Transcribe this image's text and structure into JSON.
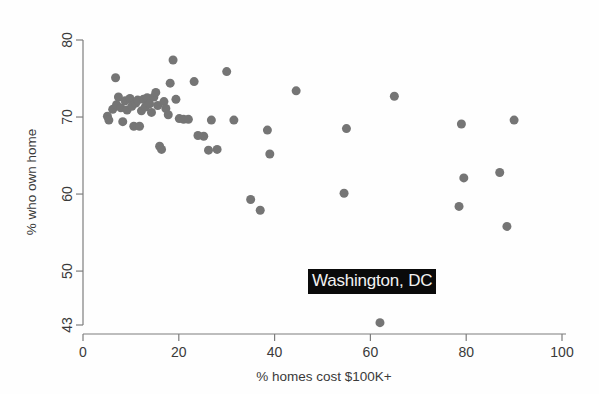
{
  "chart_data": {
    "type": "scatter",
    "title": "",
    "xlabel": "% homes cost $100K+",
    "ylabel": "% who own home",
    "xlim": [
      0,
      100
    ],
    "ylim": [
      43,
      80
    ],
    "xticks": [
      0,
      20,
      40,
      60,
      80,
      100
    ],
    "yticks": [
      43,
      50,
      60,
      70,
      80
    ],
    "grid": false,
    "legend": null,
    "marker": {
      "shape": "circle",
      "color": "#757575",
      "size": 9
    },
    "annotations": [
      {
        "label": "Washington, DC",
        "x": 62,
        "y": 48.5,
        "style": "white-on-black"
      }
    ],
    "points": [
      {
        "x": 5.1,
        "y": 70.1
      },
      {
        "x": 5.4,
        "y": 69.6
      },
      {
        "x": 6.2,
        "y": 71.0
      },
      {
        "x": 6.8,
        "y": 75.1
      },
      {
        "x": 7.0,
        "y": 71.6
      },
      {
        "x": 7.4,
        "y": 72.6
      },
      {
        "x": 7.9,
        "y": 71.2
      },
      {
        "x": 8.3,
        "y": 69.4
      },
      {
        "x": 8.8,
        "y": 72.1
      },
      {
        "x": 9.2,
        "y": 70.9
      },
      {
        "x": 9.8,
        "y": 72.4
      },
      {
        "x": 10.2,
        "y": 71.4
      },
      {
        "x": 10.6,
        "y": 68.8
      },
      {
        "x": 11.0,
        "y": 71.8
      },
      {
        "x": 11.4,
        "y": 72.2
      },
      {
        "x": 11.8,
        "y": 68.8
      },
      {
        "x": 12.2,
        "y": 70.8
      },
      {
        "x": 12.6,
        "y": 72.3
      },
      {
        "x": 13.0,
        "y": 71.3
      },
      {
        "x": 13.4,
        "y": 72.5
      },
      {
        "x": 13.9,
        "y": 71.7
      },
      {
        "x": 14.3,
        "y": 70.6
      },
      {
        "x": 14.8,
        "y": 72.6
      },
      {
        "x": 15.2,
        "y": 73.2
      },
      {
        "x": 15.6,
        "y": 71.5
      },
      {
        "x": 16.0,
        "y": 66.2
      },
      {
        "x": 16.4,
        "y": 65.8
      },
      {
        "x": 16.9,
        "y": 72.0
      },
      {
        "x": 17.3,
        "y": 71.1
      },
      {
        "x": 17.8,
        "y": 70.3
      },
      {
        "x": 18.2,
        "y": 74.4
      },
      {
        "x": 18.8,
        "y": 77.4
      },
      {
        "x": 19.4,
        "y": 72.3
      },
      {
        "x": 20.1,
        "y": 69.8
      },
      {
        "x": 21.0,
        "y": 69.7
      },
      {
        "x": 22.0,
        "y": 69.7
      },
      {
        "x": 23.2,
        "y": 74.6
      },
      {
        "x": 24.0,
        "y": 67.6
      },
      {
        "x": 25.2,
        "y": 67.5
      },
      {
        "x": 26.2,
        "y": 65.7
      },
      {
        "x": 26.8,
        "y": 69.6
      },
      {
        "x": 28.0,
        "y": 65.8
      },
      {
        "x": 30.0,
        "y": 75.9
      },
      {
        "x": 31.5,
        "y": 69.6
      },
      {
        "x": 35.0,
        "y": 59.3
      },
      {
        "x": 37.0,
        "y": 57.9
      },
      {
        "x": 38.5,
        "y": 68.3
      },
      {
        "x": 39.0,
        "y": 65.2
      },
      {
        "x": 44.5,
        "y": 73.4
      },
      {
        "x": 54.5,
        "y": 60.1
      },
      {
        "x": 55.0,
        "y": 68.5
      },
      {
        "x": 62.0,
        "y": 43.3
      },
      {
        "x": 65.0,
        "y": 72.7
      },
      {
        "x": 78.5,
        "y": 58.4
      },
      {
        "x": 79.0,
        "y": 69.1
      },
      {
        "x": 79.5,
        "y": 62.1
      },
      {
        "x": 87.0,
        "y": 62.8
      },
      {
        "x": 88.5,
        "y": 55.8
      },
      {
        "x": 90.0,
        "y": 69.6
      }
    ]
  }
}
